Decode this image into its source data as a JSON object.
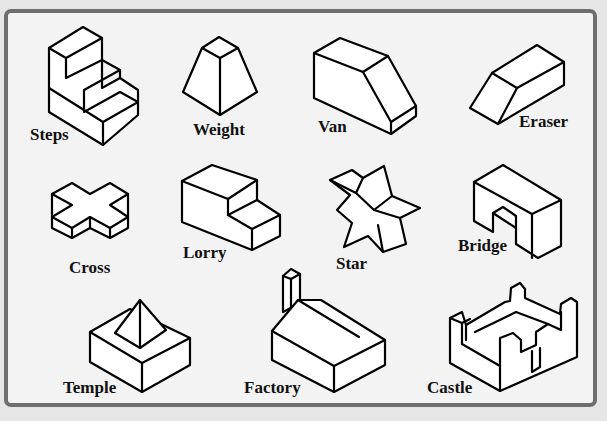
{
  "diagram": {
    "title": "",
    "shapes": [
      {
        "name": "Steps",
        "label": "Steps"
      },
      {
        "name": "Weight",
        "label": "Weight"
      },
      {
        "name": "Van",
        "label": "Van"
      },
      {
        "name": "Eraser",
        "label": "Eraser"
      },
      {
        "name": "Cross",
        "label": "Cross"
      },
      {
        "name": "Lorry",
        "label": "Lorry"
      },
      {
        "name": "Star",
        "label": "Star"
      },
      {
        "name": "Bridge",
        "label": "Bridge"
      },
      {
        "name": "Temple",
        "label": "Temple"
      },
      {
        "name": "Factory",
        "label": "Factory"
      },
      {
        "name": "Castle",
        "label": "Castle"
      }
    ],
    "colors": {
      "frame_border": "#6e6e6e",
      "panel_background": "#f3f3f3",
      "outside_background": "#e6e6e6",
      "line": "#000000",
      "fill": "#ffffff"
    }
  }
}
